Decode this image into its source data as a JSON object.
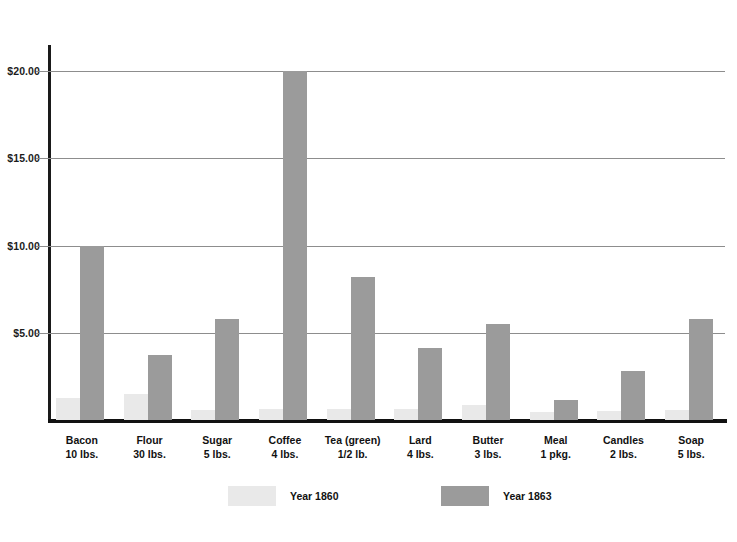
{
  "chart_data": {
    "type": "bar",
    "title": "",
    "subtitle": "",
    "xlabel": "",
    "ylabel": "",
    "ylim": [
      0,
      21.5
    ],
    "grid": true,
    "legend_position": "bottom",
    "y_ticks": [
      "$5.00",
      "$10.00",
      "$15.00",
      "$20.00"
    ],
    "y_tick_values": [
      5,
      10,
      15,
      20
    ],
    "categories": [
      {
        "name": "Bacon",
        "qty": "10 lbs."
      },
      {
        "name": "Flour",
        "qty": "30 lbs."
      },
      {
        "name": "Sugar",
        "qty": "5 lbs."
      },
      {
        "name": "Coffee",
        "qty": "4 lbs."
      },
      {
        "name": "Tea (green)",
        "qty": "1/2 lb."
      },
      {
        "name": "Lard",
        "qty": "4 lbs."
      },
      {
        "name": "Butter",
        "qty": "3 lbs."
      },
      {
        "name": "Meal",
        "qty": "1 pkg."
      },
      {
        "name": "Candles",
        "qty": "2 lbs."
      },
      {
        "name": "Soap",
        "qty": "5 lbs."
      }
    ],
    "series": [
      {
        "name": "Year 1860",
        "color": "#e9e9e9",
        "values": [
          1.25,
          1.5,
          0.6,
          0.62,
          0.62,
          0.64,
          0.85,
          0.45,
          0.52,
          0.55
        ]
      },
      {
        "name": "Year 1863",
        "color": "#9b9b9b",
        "values": [
          10.0,
          3.75,
          5.8,
          20.0,
          8.2,
          4.15,
          5.5,
          1.15,
          2.8,
          5.8
        ]
      }
    ]
  },
  "legend": {
    "items": [
      {
        "label": "Year 1860",
        "color": "#e9e9e9"
      },
      {
        "label": "Year 1863",
        "color": "#9b9b9b"
      }
    ]
  },
  "colors": {
    "axis": "#111111",
    "gridline": "#8d8d8d",
    "series_1860": "#e9e9e9",
    "series_1863": "#9b9b9b",
    "background": "#ffffff"
  }
}
